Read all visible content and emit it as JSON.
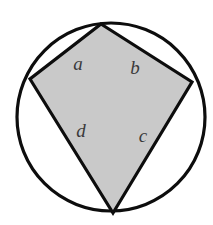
{
  "figure": {
    "background_color": "#ffffff",
    "circle": {
      "name": "circumscribed-circle",
      "cx": 111,
      "cy": 117,
      "r": 94,
      "stroke_color": "#0d0d0d",
      "stroke_width": 3.2,
      "fill": "none"
    },
    "quadrilateral": {
      "name": "inscribed-quadrilateral",
      "points": "101,24 192,82 113,213 30,79",
      "fill_color": "#c9c9c9",
      "stroke_color": "#0d0d0d",
      "stroke_width": 3.2,
      "vertices": [
        {
          "label": "top-vertex",
          "x": 101,
          "y": 24
        },
        {
          "label": "right-vertex",
          "x": 192,
          "y": 82
        },
        {
          "label": "bottom-vertex",
          "x": 113,
          "y": 213
        },
        {
          "label": "left-vertex",
          "x": 30,
          "y": 79
        }
      ]
    },
    "labels": [
      {
        "name": "label-a",
        "text": "a",
        "x": 78,
        "y": 66
      },
      {
        "name": "label-b",
        "text": "b",
        "x": 135,
        "y": 70
      },
      {
        "name": "label-d",
        "text": "d",
        "x": 81,
        "y": 133
      },
      {
        "name": "label-c",
        "text": "c",
        "x": 143,
        "y": 138
      }
    ]
  }
}
